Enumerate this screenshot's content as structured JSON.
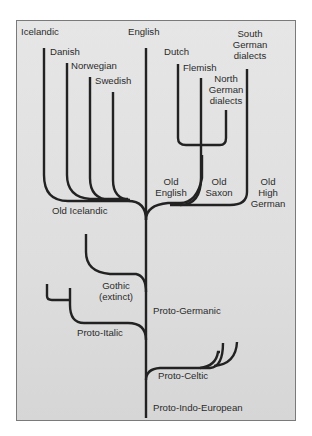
{
  "diagram": {
    "type": "language-family-tree",
    "root": "Proto-Indo-European",
    "line_color": "#222222",
    "background": "#e0e0e0",
    "labels": {
      "icelandic": "Icelandic",
      "danish": "Danish",
      "norwegian": "Norwegian",
      "swedish": "Swedish",
      "english": "English",
      "dutch": "Dutch",
      "flemish": "Flemish",
      "north_german_1": "North",
      "north_german_2": "German",
      "north_german_3": "dialects",
      "south_german_1": "South",
      "south_german_2": "German",
      "south_german_3": "dialects",
      "old_icelandic": "Old Icelandic",
      "old_english_1": "Old",
      "old_english_2": "English",
      "old_saxon_1": "Old",
      "old_saxon_2": "Saxon",
      "old_high_german_1": "Old",
      "old_high_german_2": "High",
      "old_high_german_3": "German",
      "gothic_1": "Gothic",
      "gothic_2": "(extinct)",
      "proto_germanic": "Proto-Germanic",
      "proto_italic": "Proto-Italic",
      "proto_celtic": "Proto-Celtic",
      "proto_indo_european": "Proto-Indo-European"
    },
    "tree": {
      "name": "Proto-Indo-European",
      "children": [
        {
          "name": "Proto-Italic",
          "children": [
            {
              "name": "(branch)"
            },
            {
              "name": "(branch)"
            }
          ]
        },
        {
          "name": "Proto-Celtic",
          "children": [
            {
              "name": "(branch)"
            },
            {
              "name": "(branch)"
            }
          ]
        },
        {
          "name": "Proto-Germanic",
          "children": [
            {
              "name": "Gothic (extinct)"
            },
            {
              "name": "Old Icelandic",
              "children": [
                {
                  "name": "Icelandic"
                },
                {
                  "name": "Danish"
                },
                {
                  "name": "Norwegian"
                },
                {
                  "name": "Swedish"
                }
              ]
            },
            {
              "name": "Old English",
              "children": [
                {
                  "name": "English"
                }
              ]
            },
            {
              "name": "Old Saxon",
              "children": [
                {
                  "name": "Dutch"
                },
                {
                  "name": "Flemish"
                },
                {
                  "name": "North German dialects"
                }
              ]
            },
            {
              "name": "Old High German",
              "children": [
                {
                  "name": "South German dialects"
                }
              ]
            }
          ]
        }
      ]
    }
  }
}
